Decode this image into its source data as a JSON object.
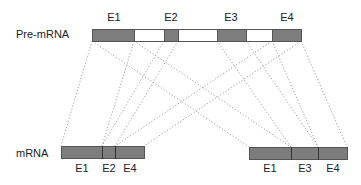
{
  "diagram": {
    "colors": {
      "exon_fill": "#7d7d7d",
      "intron_fill": "#ffffff",
      "outline": "#555555",
      "connector": "#a0a0a0",
      "text": "#222222"
    },
    "pre_mrna": {
      "label": "Pre-mRNA",
      "label_pos": [
        16,
        38
      ],
      "y": 29,
      "h": 12,
      "segments": [
        {
          "type": "exon",
          "name": "E1",
          "x0": 92,
          "x1": 134
        },
        {
          "type": "intron",
          "x0": 134,
          "x1": 164
        },
        {
          "type": "exon",
          "name": "E2",
          "x0": 164,
          "x1": 178
        },
        {
          "type": "intron",
          "x0": 178,
          "x1": 217
        },
        {
          "type": "exon",
          "name": "E3",
          "x0": 217,
          "x1": 246
        },
        {
          "type": "intron",
          "x0": 246,
          "x1": 272
        },
        {
          "type": "exon",
          "name": "E4",
          "x0": 272,
          "x1": 301
        }
      ],
      "exon_labels": [
        {
          "text": "E1",
          "x": 114,
          "y": 21
        },
        {
          "text": "E2",
          "x": 171,
          "y": 21
        },
        {
          "text": "E3",
          "x": 231,
          "y": 21
        },
        {
          "text": "E4",
          "x": 287,
          "y": 21
        }
      ]
    },
    "mrna": {
      "label": "mRNA",
      "label_pos": [
        16,
        157
      ],
      "isoforms": [
        {
          "name": "isoform-E1-E2-E4",
          "y": 146,
          "h": 12,
          "x0": 61,
          "x1": 144,
          "dividers": [
            102,
            115
          ],
          "exon_labels": [
            {
              "text": "E1",
              "x": 82,
              "y": 172
            },
            {
              "text": "E2",
              "x": 109,
              "y": 172
            },
            {
              "text": "E4",
              "x": 130,
              "y": 172
            }
          ]
        },
        {
          "name": "isoform-E1-E3-E4",
          "y": 147,
          "h": 12,
          "x0": 249,
          "x1": 347,
          "dividers": [
            291,
            318
          ],
          "exon_labels": [
            {
              "text": "E1",
              "x": 270,
              "y": 172
            },
            {
              "text": "E3",
              "x": 305,
              "y": 172
            },
            {
              "text": "E4",
              "x": 333,
              "y": 172
            }
          ]
        }
      ]
    },
    "connectors": [
      {
        "from": [
          92,
          41
        ],
        "to": [
          61,
          146
        ]
      },
      {
        "from": [
          134,
          41
        ],
        "to": [
          102,
          146
        ]
      },
      {
        "from": [
          164,
          41
        ],
        "to": [
          102,
          146
        ]
      },
      {
        "from": [
          178,
          41
        ],
        "to": [
          115,
          146
        ]
      },
      {
        "from": [
          272,
          41
        ],
        "to": [
          115,
          146
        ]
      },
      {
        "from": [
          301,
          41
        ],
        "to": [
          144,
          146
        ]
      },
      {
        "from": [
          92,
          41
        ],
        "to": [
          249,
          147
        ]
      },
      {
        "from": [
          134,
          41
        ],
        "to": [
          291,
          147
        ]
      },
      {
        "from": [
          217,
          41
        ],
        "to": [
          291,
          147
        ]
      },
      {
        "from": [
          246,
          41
        ],
        "to": [
          318,
          147
        ]
      },
      {
        "from": [
          272,
          41
        ],
        "to": [
          318,
          147
        ]
      },
      {
        "from": [
          301,
          41
        ],
        "to": [
          347,
          147
        ]
      }
    ]
  }
}
